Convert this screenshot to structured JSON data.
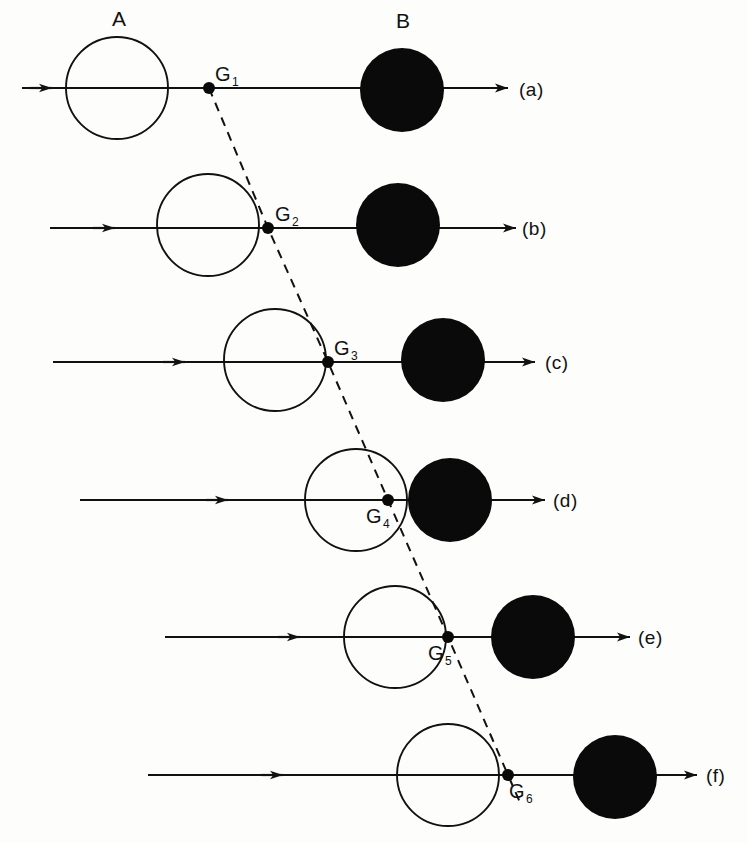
{
  "figure": {
    "width": 747,
    "height": 843,
    "background_color": "#fdfdfc",
    "stroke_color": "#111111",
    "fill_color": "#0a0a0a"
  },
  "objects": {
    "a_label": "A",
    "b_label": "B",
    "a_label_x": 112,
    "a_label_y": 8,
    "b_label_x": 396,
    "b_label_y": 10,
    "open_circle_radius": 51,
    "filled_circle_radius": 42,
    "dot_radius": 6
  },
  "rows": [
    {
      "id": "row-a",
      "row_label": "(a)",
      "row_label_x": 519,
      "row_label_y": 80,
      "axis_y": 88,
      "axis_start_x": 22,
      "axis_end_x": 508,
      "mid_arrow_x": 52,
      "circle_a_cx": 117,
      "circle_a_cy": 88,
      "circle_b_cx": 402,
      "circle_b_cy": 90,
      "point_label": "G",
      "point_subscript": "1",
      "point_x": 209,
      "point_y": 88,
      "point_label_x": 215,
      "point_label_y": 64
    },
    {
      "id": "row-b",
      "row_label": "(b)",
      "row_label_x": 522,
      "row_label_y": 219,
      "axis_y": 228,
      "axis_start_x": 50,
      "axis_end_x": 516,
      "mid_arrow_x": 115,
      "circle_a_cx": 208,
      "circle_a_cy": 225,
      "circle_b_cx": 398,
      "circle_b_cy": 225,
      "point_label": "G",
      "point_subscript": "2",
      "point_x": 268,
      "point_y": 228,
      "point_label_x": 275,
      "point_label_y": 204
    },
    {
      "id": "row-c",
      "row_label": "(c)",
      "row_label_x": 545,
      "row_label_y": 353,
      "axis_y": 362,
      "axis_start_x": 53,
      "axis_end_x": 535,
      "mid_arrow_x": 185,
      "circle_a_cx": 275,
      "circle_a_cy": 360,
      "circle_b_cx": 443,
      "circle_b_cy": 360,
      "point_label": "G",
      "point_subscript": "3",
      "point_x": 328,
      "point_y": 362,
      "point_label_x": 334,
      "point_label_y": 338
    },
    {
      "id": "row-d",
      "row_label": "(d)",
      "row_label_x": 553,
      "row_label_y": 491,
      "axis_y": 500,
      "axis_start_x": 80,
      "axis_end_x": 545,
      "mid_arrow_x": 228,
      "circle_a_cx": 356,
      "circle_a_cy": 500,
      "circle_b_cx": 450,
      "circle_b_cy": 500,
      "point_label": "G",
      "point_subscript": "4",
      "point_x": 388,
      "point_y": 500,
      "point_label_x": 366,
      "point_label_y": 506
    },
    {
      "id": "row-e",
      "row_label": "(e)",
      "row_label_x": 638,
      "row_label_y": 628,
      "axis_y": 637,
      "axis_start_x": 165,
      "axis_end_x": 630,
      "mid_arrow_x": 300,
      "circle_a_cx": 395,
      "circle_a_cy": 637,
      "circle_b_cx": 533,
      "circle_b_cy": 637,
      "point_label": "G",
      "point_subscript": "5",
      "point_x": 448,
      "point_y": 637,
      "point_label_x": 428,
      "point_label_y": 643
    },
    {
      "id": "row-f",
      "row_label": "(f)",
      "row_label_x": 706,
      "row_label_y": 766,
      "axis_y": 775,
      "axis_start_x": 148,
      "axis_end_x": 697,
      "mid_arrow_x": 283,
      "circle_a_cx": 448,
      "circle_a_cy": 775,
      "circle_b_cx": 615,
      "circle_b_cy": 777,
      "point_label": "G",
      "point_subscript": "6",
      "point_x": 508,
      "point_y": 775,
      "point_label_x": 509,
      "point_label_y": 781
    }
  ],
  "dashed_path": {
    "name": "contact-locus",
    "dash_pattern": "9,7",
    "points": [
      [
        209,
        88
      ],
      [
        268,
        228
      ],
      [
        328,
        362
      ],
      [
        388,
        500
      ],
      [
        448,
        637
      ],
      [
        508,
        775
      ]
    ],
    "start_extension": [
      209,
      88
    ],
    "end_extension": [
      508,
      775
    ]
  }
}
